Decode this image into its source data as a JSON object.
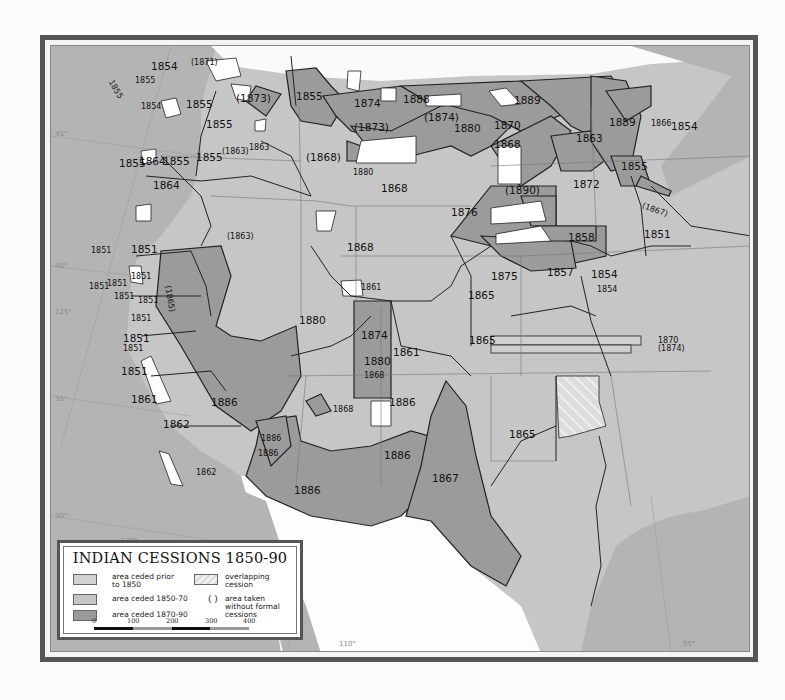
{
  "map": {
    "title": "INDIAN CESSIONS 1850-90",
    "colors": {
      "ocean": "#b5b5b5",
      "prior_1850": "#d2d2d2",
      "ceded_1850_70": "#c9c9c9",
      "ceded_1870_90": "#9a9a9a",
      "uncovered": "#ffffff",
      "frame": "#555555",
      "boundary": "#222222"
    },
    "graticule_labels": {
      "lat_45": "45°",
      "lat_40": "40°",
      "lat_35": "35°",
      "lat_30": "30°",
      "lon_125": "125°",
      "lon_120": "120°",
      "lon_110": "110°",
      "lon_95": "95°"
    },
    "cession_labels": [
      {
        "id": "wa-1854-n",
        "text": "1854"
      },
      {
        "id": "wa-1871",
        "text": "(1871)"
      },
      {
        "id": "wa-1855-coast",
        "text": "1855"
      },
      {
        "id": "wa-1855-b",
        "text": "1855"
      },
      {
        "id": "wa-1854-puget",
        "text": "1854"
      },
      {
        "id": "wa-1855-c",
        "text": "1855"
      },
      {
        "id": "mt-1873-w",
        "text": "(1873)"
      },
      {
        "id": "mt-1855",
        "text": "1855"
      },
      {
        "id": "wa-1864",
        "text": "1864"
      },
      {
        "id": "id-1855",
        "text": "1855"
      },
      {
        "id": "id-1863",
        "text": "(1863)"
      },
      {
        "id": "id-1863b",
        "text": "1863"
      },
      {
        "id": "or-1855-w",
        "text": "1855"
      },
      {
        "id": "or-1855-e",
        "text": "1855"
      },
      {
        "id": "or-1855-c",
        "text": "1855"
      },
      {
        "id": "or-1864",
        "text": "1864"
      },
      {
        "id": "mt-1874",
        "text": "1874"
      },
      {
        "id": "mt-1888",
        "text": "1888"
      },
      {
        "id": "mt-1873",
        "text": "(1873)"
      },
      {
        "id": "mt-1874p",
        "text": "(1874)"
      },
      {
        "id": "nd-1880",
        "text": "1880"
      },
      {
        "id": "nd-1870",
        "text": "1870"
      },
      {
        "id": "nd-1889",
        "text": "1889"
      },
      {
        "id": "sd-1868",
        "text": "1868"
      },
      {
        "id": "wy-1868p",
        "text": "(1868)"
      },
      {
        "id": "wy-1880",
        "text": "1880"
      },
      {
        "id": "wy-1868",
        "text": "1868"
      },
      {
        "id": "sd-1876",
        "text": "1876"
      },
      {
        "id": "sd-1890",
        "text": "(1890)"
      },
      {
        "id": "mn-1863",
        "text": "1863"
      },
      {
        "id": "mn-1889",
        "text": "1889"
      },
      {
        "id": "wi-1866",
        "text": "1866"
      },
      {
        "id": "wi-1854",
        "text": "1854"
      },
      {
        "id": "mn-1855",
        "text": "1855"
      },
      {
        "id": "mn-1872",
        "text": "1872"
      },
      {
        "id": "mn-1867",
        "text": "(1867)"
      },
      {
        "id": "ia-1851",
        "text": "1851"
      },
      {
        "id": "ne-1858",
        "text": "1858"
      },
      {
        "id": "ne-1857",
        "text": "1857"
      },
      {
        "id": "ne-1854",
        "text": "1854"
      },
      {
        "id": "ne-1854b",
        "text": "1854"
      },
      {
        "id": "ne-1875",
        "text": "1875"
      },
      {
        "id": "nv-1863",
        "text": "(1863)"
      },
      {
        "id": "ut-1868",
        "text": "1868"
      },
      {
        "id": "ca-1851-a",
        "text": "1851"
      },
      {
        "id": "ca-1851-b",
        "text": "1851"
      },
      {
        "id": "ca-1851-c",
        "text": "1851"
      },
      {
        "id": "ca-1851-d",
        "text": "1851"
      },
      {
        "id": "ca-1865",
        "text": "(1865)"
      },
      {
        "id": "ca-1851-e",
        "text": "1851"
      },
      {
        "id": "ca-1851-f",
        "text": "1851"
      },
      {
        "id": "ca-1851-g",
        "text": "1851"
      },
      {
        "id": "ca-1851-h",
        "text": "1851"
      },
      {
        "id": "ca-1851-i",
        "text": "1851"
      },
      {
        "id": "ca-1851-j",
        "text": "1851"
      },
      {
        "id": "ca-1851-k",
        "text": "1851"
      },
      {
        "id": "ca-1862-a",
        "text": "1862"
      },
      {
        "id": "ca-1862-b",
        "text": "1862"
      },
      {
        "id": "ut-1861-small",
        "text": "1861"
      },
      {
        "id": "ut-1861",
        "text": "1861"
      },
      {
        "id": "co-1880",
        "text": "1880"
      },
      {
        "id": "co-1874",
        "text": "1874"
      },
      {
        "id": "co-1880b",
        "text": "1880"
      },
      {
        "id": "co-1868",
        "text": "1868"
      },
      {
        "id": "ks-1861",
        "text": "1861"
      },
      {
        "id": "ks-1865",
        "text": "1865"
      },
      {
        "id": "ok-1865",
        "text": "1865"
      },
      {
        "id": "ok-1870",
        "text": "1870"
      },
      {
        "id": "nv-1874",
        "text": "(1874)"
      },
      {
        "id": "az-1886-a",
        "text": "1886"
      },
      {
        "id": "az-1886-b",
        "text": "1886"
      },
      {
        "id": "nm-1886-small",
        "text": "1886"
      },
      {
        "id": "nm-1868",
        "text": "1868"
      },
      {
        "id": "az-1886-c",
        "text": "1886"
      },
      {
        "id": "az-1886-d",
        "text": "1886"
      },
      {
        "id": "tx-1886",
        "text": "1886"
      },
      {
        "id": "tx-1867",
        "text": "1867"
      },
      {
        "id": "tx-1865",
        "text": "1865"
      }
    ]
  },
  "legend": {
    "title": "INDIAN CESSIONS 1850-90",
    "items": [
      {
        "label_line1": "area ceded prior",
        "label_line2": "to 1850"
      },
      {
        "label_line1": "area ceded 1850-70"
      },
      {
        "label_line1": "area ceded 1870-90"
      },
      {
        "label_line1": "overlapping",
        "label_line2": "cession"
      },
      {
        "symbol": "( )",
        "label_line1": "area taken",
        "label_line2": "without formal",
        "label_line3": "cessions"
      }
    ],
    "scale": {
      "ticks": [
        "0",
        "100",
        "200",
        "300",
        "400"
      ]
    }
  }
}
